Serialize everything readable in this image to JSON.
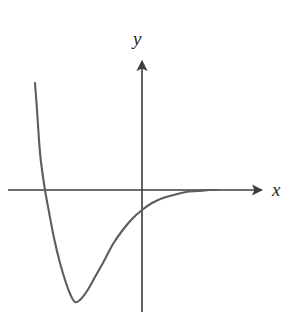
{
  "figure": {
    "title": "",
    "background_color": "#ffffff",
    "width": 298,
    "height": 322,
    "axis_color": "#3c3c3c",
    "curve_color": "#5d5d5d",
    "label_color": "#262626"
  },
  "axes": {
    "x_label": "x",
    "y_label": "y",
    "x_axis": {
      "name": "x-axis",
      "start_px": [
        8,
        190
      ],
      "end_px": [
        265,
        190
      ],
      "arrow": "right"
    },
    "y_axis": {
      "name": "y-axis",
      "start_px": [
        142,
        312
      ],
      "end_px": [
        142,
        57
      ],
      "arrow": "up"
    }
  },
  "chart_data": {
    "type": "line",
    "title": "",
    "xlabel": "x",
    "ylabel": "y",
    "grid": false,
    "legend": null,
    "series": [
      {
        "name": "curve",
        "description": "Curve descending steeply from upper left, crossing the x-axis, reaching a minimum below the axis, then rising and approaching the x-axis asymptotically from below on the right",
        "points_px": [
          [
            35,
            83
          ],
          [
            37,
            110
          ],
          [
            39,
            140
          ],
          [
            41,
            162
          ],
          [
            45,
            190
          ],
          [
            49,
            212
          ],
          [
            54,
            238
          ],
          [
            60,
            263
          ],
          [
            66,
            283
          ],
          [
            71,
            296
          ],
          [
            75,
            302
          ],
          [
            80,
            300
          ],
          [
            87,
            291
          ],
          [
            95,
            277
          ],
          [
            104,
            261
          ],
          [
            113,
            244
          ],
          [
            122,
            231
          ],
          [
            132,
            219
          ],
          [
            142,
            210
          ],
          [
            152,
            203
          ],
          [
            163,
            198
          ],
          [
            174,
            195
          ],
          [
            186,
            192
          ],
          [
            198,
            191
          ],
          [
            210,
            190
          ],
          [
            218,
            190
          ]
        ],
        "features": {
          "x_intercept_px": [
            45,
            190
          ],
          "minimum_px": [
            75,
            302
          ],
          "y_axis_crossing_px": [
            142,
            210
          ],
          "asymptote": "y = 0 (the x-axis), approached from below as x increases"
        }
      }
    ],
    "x_range_px": [
      8,
      265
    ],
    "y_range_px": [
      57,
      312
    ]
  }
}
